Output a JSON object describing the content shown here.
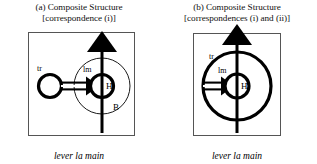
{
  "figure": {
    "caption_text": "lever la main",
    "colors": {
      "ink": "#000000",
      "box_border": "#555555",
      "background": "#ffffff"
    }
  },
  "panels": [
    {
      "id": "a",
      "title_line1": "(a) Composite Structure",
      "title_line2": "[correspondence (i)]",
      "caption": "lever la main",
      "labels": {
        "tr": "tr",
        "lm": "lm",
        "h": "H",
        "b": "B"
      },
      "elements": {
        "outer_circle_label": "B",
        "inner_circle_label": "lm",
        "core_label": "H",
        "source_circle_label": "tr",
        "horizontal_arrow": "double-line arrow pointing right",
        "vertical_arrow": "bold arrow pointing up"
      }
    },
    {
      "id": "b",
      "title_line1": "(b) Composite Structure",
      "title_line2": "[correspondences (i) and (ii)]",
      "caption": "lever la main",
      "labels": {
        "tr": "tr",
        "lm": "lm",
        "h": "H"
      },
      "elements": {
        "outer_circle_label": "tr",
        "inner_circle_label": "lm",
        "core_label": "H",
        "horizontal_arrow": "double-line arrow pointing right",
        "vertical_arrow": "bold arrow pointing up"
      }
    }
  ]
}
